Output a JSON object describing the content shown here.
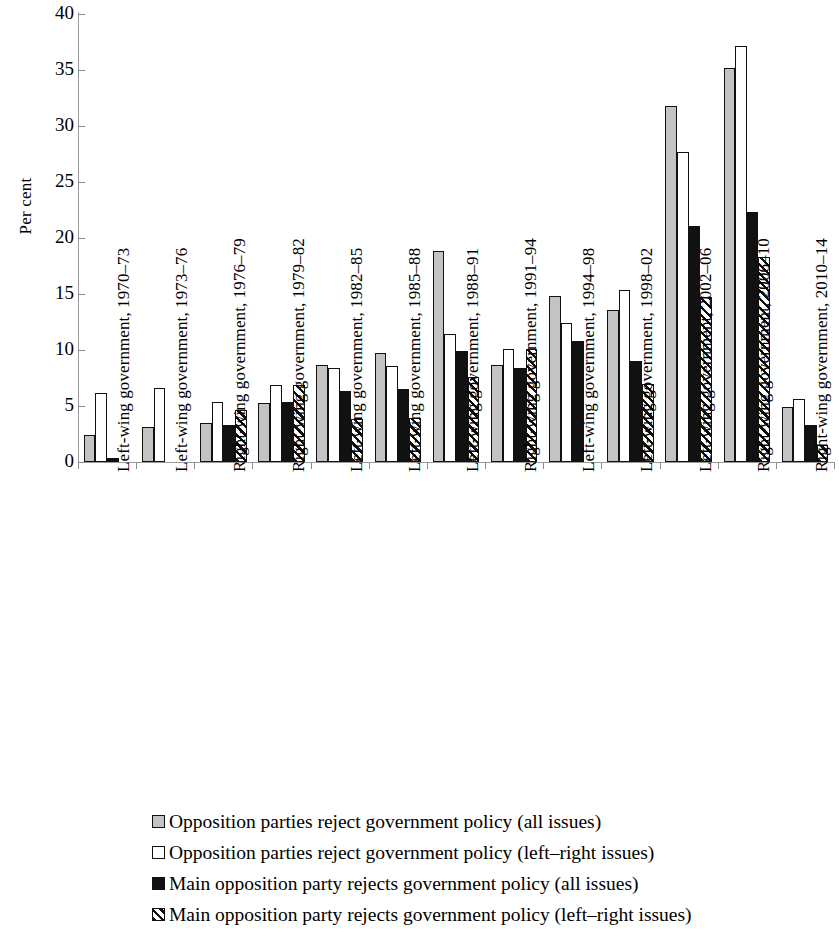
{
  "chart_data": {
    "type": "bar",
    "title": "",
    "xlabel": "",
    "ylabel": "Per cent",
    "ylim": [
      0,
      40
    ],
    "yticks": [
      0,
      5,
      10,
      15,
      20,
      25,
      30,
      35,
      40
    ],
    "ytick_labels": [
      "0",
      "5",
      "10",
      "15",
      "20",
      "25",
      "30",
      "35",
      "40"
    ],
    "grid": false,
    "legend_position": "bottom",
    "categories": [
      "Left-wing government, 1970–73",
      "Left-wing government, 1973–76",
      "Right-wing government, 1976–79",
      "Right-wing government, 1979–82",
      "Left-wing government, 1982–85",
      "Left-wing government, 1985–88",
      "Left-wing government, 1988–91",
      "Right-wing government, 1991–94",
      "Left-wing government, 1994–98",
      "Left-wing government, 1998–02",
      "Left-wing government, 2002–06",
      "Right-wing government, 2006–10",
      "Right-wing government, 2010–14"
    ],
    "series": [
      {
        "name": "Opposition parties reject government policy (all issues)",
        "color": "#c3c3c3",
        "pattern": "solid-grey",
        "values": [
          2.4,
          3.1,
          3.5,
          5.3,
          8.7,
          9.7,
          18.8,
          8.7,
          14.8,
          13.6,
          31.8,
          35.2,
          4.9
        ]
      },
      {
        "name": "Opposition parties reject government policy (left–right issues)",
        "color": "#ffffff",
        "pattern": "white",
        "values": [
          6.2,
          6.6,
          5.4,
          6.9,
          8.4,
          8.6,
          11.4,
          10.1,
          12.4,
          15.4,
          27.7,
          37.1,
          5.6
        ]
      },
      {
        "name": "Main opposition party rejects government policy (all issues)",
        "color": "#111111",
        "pattern": "solid-black",
        "values": [
          0.4,
          0.0,
          3.3,
          5.4,
          6.3,
          6.5,
          9.9,
          8.4,
          10.8,
          9.0,
          21.1,
          22.3,
          3.3
        ]
      },
      {
        "name": "Main opposition party rejects government policy (left–right issues)",
        "color": "#ffffff",
        "pattern": "diagonal-hatch",
        "values": [
          0.0,
          0.0,
          4.6,
          6.9,
          3.8,
          3.9,
          7.6,
          10.1,
          0.0,
          7.0,
          14.7,
          18.3,
          1.5
        ]
      }
    ]
  },
  "legend": {
    "items": [
      {
        "label": "Opposition parties reject government policy (all issues)",
        "swatch": "solid-grey"
      },
      {
        "label": "Opposition parties reject government policy (left–right issues)",
        "swatch": "white"
      },
      {
        "label": "Main opposition party rejects government policy (all issues)",
        "swatch": "solid-black"
      },
      {
        "label": "Main opposition party rejects government policy (left–right issues)",
        "swatch": "diagonal-hatch"
      }
    ]
  }
}
